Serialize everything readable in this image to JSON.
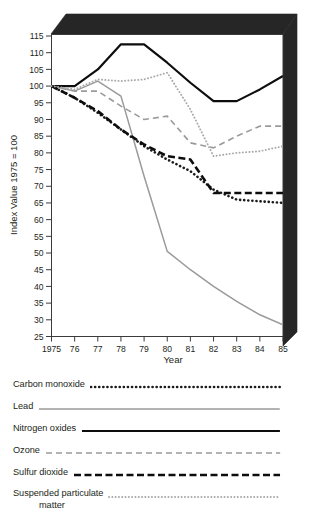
{
  "chart_data": {
    "type": "line",
    "title": "",
    "xlabel": "Year",
    "ylabel": "Index Value 1975 = 100",
    "x": [
      1975,
      1976,
      1977,
      1978,
      1979,
      1980,
      1981,
      1982,
      1983,
      1984,
      1985
    ],
    "xticklabels": [
      "1975",
      "76",
      "77",
      "78",
      "79",
      "80",
      "81",
      "82",
      "83",
      "84",
      "85"
    ],
    "yticklabels": [
      "25",
      "30",
      "35",
      "40",
      "45",
      "50",
      "55",
      "60",
      "65",
      "70",
      "75",
      "80",
      "85",
      "90",
      "95",
      "100",
      "105",
      "110",
      "115"
    ],
    "ylim": [
      25,
      115
    ],
    "ytick_step": 5,
    "grid": false,
    "legend_position": "below",
    "series": [
      {
        "name": "Carbon monoxide",
        "style": "dotted",
        "color": "#1a1a1a",
        "values": [
          100,
          96.5,
          92,
          87,
          82,
          78,
          74.5,
          69,
          66,
          65.5,
          65
        ]
      },
      {
        "name": "Lead",
        "style": "solid-thin",
        "color": "#9a9a9a",
        "values": [
          100,
          98.5,
          101.5,
          97,
          73,
          50.5,
          45,
          40,
          35.5,
          31.5,
          28.5
        ]
      },
      {
        "name": "Nitrogen oxides",
        "style": "solid-thick",
        "color": "#0d0d0d",
        "values": [
          100,
          100,
          105,
          112.5,
          112.5,
          107,
          101,
          95.5,
          95.5,
          99,
          103
        ]
      },
      {
        "name": "Ozone",
        "style": "dashed-long",
        "color": "#9a9a9a",
        "values": [
          100,
          98.5,
          98.5,
          94,
          90,
          91,
          83,
          81.5,
          85,
          88,
          88
        ]
      },
      {
        "name": "Sulfur dioxide",
        "style": "dashed-bold",
        "color": "#0d0d0d",
        "values": [
          100,
          96.5,
          92.5,
          87,
          82.5,
          79,
          78,
          68,
          68,
          68,
          68
        ]
      },
      {
        "name": "Suspended particulate matter",
        "style": "dotted-light",
        "color": "#a8a8a8",
        "values": [
          100,
          99,
          102,
          101.5,
          102,
          104,
          93,
          79,
          80,
          80.5,
          82
        ]
      }
    ]
  },
  "legend": {
    "items": [
      {
        "label": "Carbon monoxide",
        "label2": "",
        "style": "dotted",
        "color": "#1a1a1a"
      },
      {
        "label": "Lead",
        "label2": "",
        "style": "solid-thin",
        "color": "#9a9a9a"
      },
      {
        "label": "Nitrogen oxides",
        "label2": "",
        "style": "solid-thick",
        "color": "#0d0d0d"
      },
      {
        "label": "Ozone",
        "label2": "",
        "style": "dashed-long",
        "color": "#9a9a9a"
      },
      {
        "label": "Sulfur dioxide",
        "label2": "",
        "style": "dashed-bold",
        "color": "#0d0d0d"
      },
      {
        "label": "Suspended particulate",
        "label2": "matter",
        "style": "dotted-light",
        "color": "#a8a8a8"
      }
    ]
  },
  "colors": {
    "frame_shadow": "#262626",
    "axis": "#3b3b3b",
    "text": "#231f20",
    "plot_background": "#ffffff"
  }
}
